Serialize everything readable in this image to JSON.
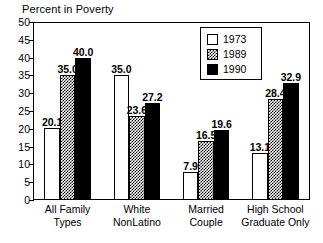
{
  "chart_data": {
    "type": "bar",
    "title": "Percent in Poverty",
    "xlabel": "",
    "ylabel": "",
    "ylim": [
      0,
      50
    ],
    "yticks": [
      0,
      5,
      10,
      15,
      20,
      25,
      30,
      35,
      40,
      45,
      50
    ],
    "grid": false,
    "legend_position": "top-right",
    "categories": [
      "All Family Types",
      "White NonLatino",
      "Married Couple",
      "High School Graduate Only"
    ],
    "category_lines": [
      [
        "All Family",
        "Types"
      ],
      [
        "White",
        "NonLatino"
      ],
      [
        "Married",
        "Couple"
      ],
      [
        "High School",
        "Graduate Only"
      ]
    ],
    "series": [
      {
        "name": "1973",
        "fill": "white",
        "color": "#ffffff",
        "values": [
          20.1,
          35.0,
          7.9,
          13.1
        ],
        "labels": [
          "20.1",
          "35.0",
          "7.9",
          "13.1"
        ]
      },
      {
        "name": "1989",
        "fill": "stippled-gray",
        "color": "#999999",
        "values": [
          35.0,
          23.6,
          16.5,
          28.4
        ],
        "labels": [
          "35.0",
          "23.6",
          "16.5",
          "28.4"
        ]
      },
      {
        "name": "1990",
        "fill": "solid-black",
        "color": "#000000",
        "values": [
          40.0,
          27.2,
          19.6,
          32.9
        ],
        "labels": [
          "40.0",
          "27.2",
          "19.6",
          "32.9"
        ]
      }
    ]
  },
  "legend": {
    "entries": [
      {
        "label": "1973"
      },
      {
        "label": "1989"
      },
      {
        "label": "1990"
      }
    ]
  },
  "axis": {
    "y_tick_labels": [
      "50",
      "45",
      "40",
      "35",
      "30",
      "25",
      "20",
      "15",
      "10",
      "5",
      "0"
    ]
  }
}
